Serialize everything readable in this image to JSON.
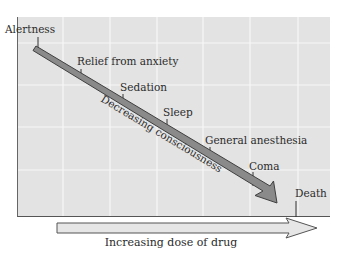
{
  "diagram": {
    "stages": [
      {
        "label": "Alertness",
        "x": 22,
        "y": 24,
        "tick_x": 38,
        "tick_y1": 36,
        "tick_y2": 51
      },
      {
        "label": "Relief from anxiety",
        "x": 77,
        "y": 56,
        "tick_x": 81,
        "tick_y1": 68,
        "tick_y2": 80
      },
      {
        "label": "Sedation",
        "x": 120,
        "y": 81,
        "tick_x": 123,
        "tick_y1": 93,
        "tick_y2": 105
      },
      {
        "label": "Sleep",
        "x": 163,
        "y": 106,
        "tick_x": 167,
        "tick_y1": 118,
        "tick_y2": 131
      },
      {
        "label": "General anesthesia",
        "x": 205,
        "y": 135,
        "tick_x": 210,
        "tick_y1": 147,
        "tick_y2": 157
      },
      {
        "label": "Coma",
        "x": 249,
        "y": 160,
        "tick_x": 253,
        "tick_y1": 172,
        "tick_y2": 186
      },
      {
        "label": "Death",
        "x": 295,
        "y": 188,
        "tick_x": 296,
        "tick_y1": 201,
        "tick_y2": 217
      }
    ],
    "diagonal_label": "Decreasing consciousness",
    "x_axis_label": "Increasing dose of drug",
    "colors": {
      "plot_background": "#e3e3e3",
      "grid": "#f7f7f7",
      "arrow_fill": "#8a8a8a",
      "arrow_stroke": "#3f3f3f",
      "dose_arrow_fill": "#e6e6e6"
    }
  }
}
